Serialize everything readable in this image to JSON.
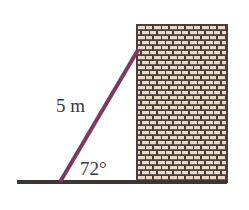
{
  "diagram": {
    "type": "ladder-against-wall",
    "ladder": {
      "length_label": "5 m",
      "color": "#7a3a62"
    },
    "angle": {
      "label": "72°",
      "value_degrees": 72
    },
    "wall": {
      "pattern": "brick",
      "brick_color": "#eadbc8",
      "mortar_color": "#4b3d39"
    },
    "ground": {
      "color": "#3e3434"
    }
  }
}
